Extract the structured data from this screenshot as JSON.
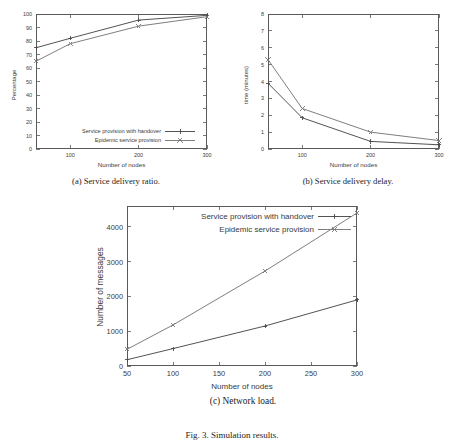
{
  "figure": {
    "caption": "Fig. 3. Simulation results."
  },
  "panels": [
    {
      "id": "a",
      "caption": "(a) Service delivery ratio.",
      "chart_data": {
        "type": "line",
        "title": "",
        "xlabel": "Number of nodes",
        "ylabel": "Percentage",
        "xlim": [
          50,
          300
        ],
        "ylim": [
          0,
          100
        ],
        "xticks": [
          100,
          200,
          300
        ],
        "yticks": [
          0,
          10,
          20,
          30,
          40,
          50,
          60,
          70,
          80,
          90,
          100
        ],
        "grid": false,
        "legend_position": "bottom-left",
        "x": [
          50,
          100,
          200,
          300
        ],
        "series": [
          {
            "name": "Service provision with handover",
            "values": [
              75,
              82,
              95.5,
              99
            ],
            "color": "#4a4a4a",
            "marker": "plus"
          },
          {
            "name": "Epidemic service provision",
            "values": [
              65,
              78,
              91,
              98
            ],
            "color": "#777777",
            "marker": "cross"
          }
        ]
      }
    },
    {
      "id": "b",
      "caption": "(b) Service delivery delay.",
      "chart_data": {
        "type": "line",
        "title": "",
        "xlabel": "Number of nodes",
        "ylabel": "time (minutes)",
        "xlim": [
          50,
          300
        ],
        "ylim": [
          0,
          8
        ],
        "xticks": [
          100,
          200,
          300
        ],
        "yticks": [
          0,
          1,
          2,
          3,
          4,
          5,
          6,
          7,
          8
        ],
        "grid": false,
        "legend_position": "top-left",
        "x": [
          50,
          100,
          200,
          300
        ],
        "series": [
          {
            "name": "Service provision with handover",
            "values": [
              3.9,
              1.85,
              0.45,
              0.25
            ],
            "color": "#4a4a4a",
            "marker": "plus"
          },
          {
            "name": "Epidemic service provision",
            "values": [
              5.3,
              2.4,
              1.0,
              0.5
            ],
            "color": "#777777",
            "marker": "cross"
          }
        ]
      }
    },
    {
      "id": "c",
      "caption": "(c) Network load.",
      "chart_data": {
        "type": "line",
        "title": "",
        "xlabel": "Number of nodes",
        "ylabel": "Number of messages",
        "xlim": [
          50,
          300
        ],
        "ylim": [
          0,
          4600
        ],
        "xticks": [
          50,
          100,
          150,
          200,
          250,
          300
        ],
        "yticks": [
          0,
          1000,
          2000,
          3000,
          4000
        ],
        "grid": false,
        "legend_position": "top-right",
        "x": [
          50,
          100,
          200,
          300
        ],
        "series": [
          {
            "name": "Service provision with handover",
            "values": [
              180,
              500,
              1150,
              1900
            ],
            "color": "#4a4a4a",
            "marker": "plus"
          },
          {
            "name": "Epidemic service provision",
            "values": [
              480,
              1180,
              2730,
              4400
            ],
            "color": "#777777",
            "marker": "cross"
          }
        ]
      }
    }
  ]
}
